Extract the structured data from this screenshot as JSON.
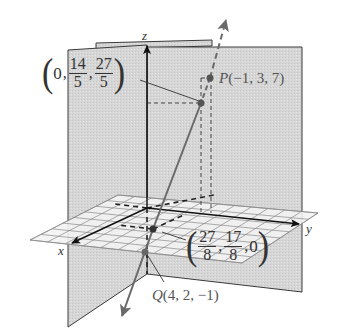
{
  "figure": {
    "axes": {
      "x_label": "x",
      "y_label": "y",
      "z_label": "z"
    },
    "points": {
      "P": {
        "label_name": "P",
        "label_coords": "(−1, 3, 7)",
        "coords": [
          -1,
          3,
          7
        ]
      },
      "Q": {
        "label_name": "Q",
        "label_coords": "(4, 2, −1)",
        "coords": [
          4,
          2,
          -1
        ]
      },
      "yz_intersection": {
        "open": "(",
        "first": "0",
        "second_num": "14",
        "second_den": "5",
        "third_num": "27",
        "third_den": "5",
        "close": ")",
        "coords": [
          0,
          2.8,
          5.4
        ]
      },
      "xy_intersection": {
        "open": "(",
        "first_num": "27",
        "first_den": "8",
        "second_num": "17",
        "second_den": "8",
        "third": "0",
        "close": ")",
        "coords": [
          3.375,
          2.125,
          0
        ]
      }
    },
    "colors": {
      "plane_fill": "#d9d9d9",
      "plane_edge": "#3a3a3a",
      "grid_fill": "#f4f4f4",
      "grid_line": "#7a7a7a",
      "line_color": "#6e6e6e",
      "axis_color": "#1a1a1a",
      "text_color": "#333333"
    }
  }
}
